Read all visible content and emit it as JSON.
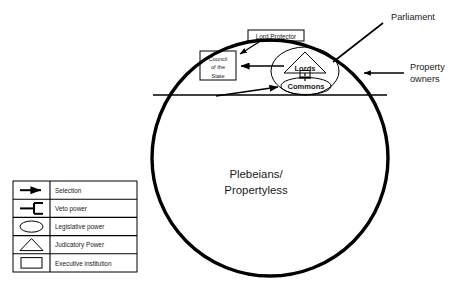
{
  "diagram": {
    "title": "",
    "outer_circle": {
      "name": "polity-circle",
      "cx": 270,
      "cy": 158,
      "r": 118,
      "stroke": "#000000",
      "stroke_width": 3.4
    },
    "divider_line": {
      "name": "franchise-divider",
      "y": 95
    },
    "nodes": {
      "lord_protector": {
        "label": "Lord Protector",
        "shape": "rectangle",
        "meaning": "Executive institution"
      },
      "council_of_state": {
        "label_lines": [
          "Council",
          "of the",
          "State"
        ],
        "shape": "rectangle",
        "meaning": "Executive institution"
      },
      "parliament": {
        "label": "Parliament",
        "shape": "ellipse",
        "meaning": "Legislative power"
      },
      "lords": {
        "label": "Lords",
        "shape": "triangle",
        "meaning": "Judicatory Power"
      },
      "commons": {
        "label": "Commons",
        "shape": "ellipse",
        "meaning": "Legislative power"
      },
      "property_owners": {
        "label_lines": [
          "Property",
          "owners"
        ]
      },
      "plebeians": {
        "label_lines": [
          "Plebeians/",
          "Propertyless"
        ]
      }
    }
  },
  "legend": {
    "name": "legend-table",
    "rows": [
      {
        "symbol": "arrow",
        "label": "Selection"
      },
      {
        "symbol": "veto-bracket",
        "label": "Veto power"
      },
      {
        "symbol": "ellipse",
        "label": "Legislative power"
      },
      {
        "symbol": "triangle",
        "label": "Judicatory Power"
      },
      {
        "symbol": "rectangle",
        "label": "Executive institution"
      }
    ]
  },
  "colors": {
    "stroke": "#000000",
    "text": "#1a1a1a",
    "background": "#ffffff"
  }
}
